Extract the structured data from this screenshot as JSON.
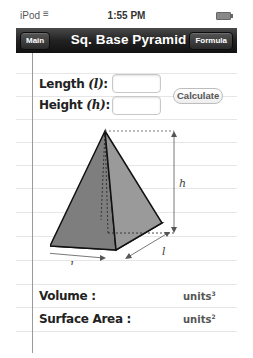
{
  "status_bar": {
    "carrier": "iPod",
    "wifi_icon": "wifi-icon",
    "time": "1:55 PM",
    "battery_icon": "battery-icon"
  },
  "nav": {
    "title": "Sq. Base Pyramid",
    "left_button": "Main",
    "right_button": "Formula"
  },
  "inputs": {
    "length_label": "Length",
    "length_var": "(l)",
    "length_colon": ":",
    "length_value": "",
    "height_label": "Height",
    "height_var": "(h)",
    "height_colon": ":",
    "height_value": "",
    "calculate_label": "Calculate"
  },
  "diagram": {
    "height_label": "h",
    "length_label_front": "l",
    "length_label_side": "l"
  },
  "results": {
    "volume_label": "Volume :",
    "volume_value": "",
    "volume_units": "units",
    "volume_exp": "3",
    "surface_label": "Surface Area :",
    "surface_value": "",
    "surface_units": "units",
    "surface_exp": "2"
  }
}
